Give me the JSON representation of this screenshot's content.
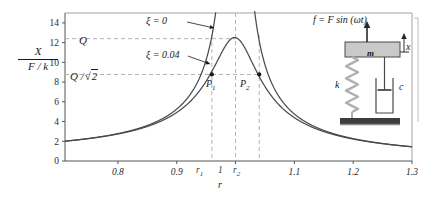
{
  "figure": {
    "y_axis_label_num": "X",
    "y_axis_label_den": "F / k",
    "x_axis_label": "r",
    "level_labels": {
      "q": "Q",
      "q_over_sqrt2_prefix": "Q /",
      "q_over_sqrt2_radicand": "2"
    },
    "point_labels": {
      "p1": "P",
      "p1_sub": "1",
      "p2": "P",
      "p2_sub": "2"
    },
    "curve_labels": {
      "undamped": "ξ = 0",
      "damped": "ξ = 0.04"
    },
    "special_x_ticks": {
      "r1": "r",
      "r1_sub": "1",
      "r2": "r",
      "r2_sub": "2",
      "unity": "1"
    },
    "colors": {
      "curve": "#4a4a52",
      "axis": "#8a8a8a",
      "dashed": "#a8a8b0",
      "mass_fill": "#c9c9c9",
      "ground": "#3d3d3d",
      "spring": "#b0b0b0"
    }
  },
  "inset": {
    "force_label": "f = F sin (ωt)",
    "mass_label": "m",
    "spring_label": "k",
    "damper_label": "c",
    "displacement_label": "x"
  },
  "chart_data": {
    "type": "line",
    "title": "",
    "xlabel": "r",
    "ylabel": "X / (F / k)",
    "xlim": [
      0.71,
      1.3
    ],
    "ylim": [
      0,
      15
    ],
    "xticks": [
      0.8,
      0.9,
      1.0,
      1.1,
      1.2,
      1.3
    ],
    "xtick_labels": [
      "0.8",
      "0.9",
      "1",
      "1.1",
      "1.2",
      "1.3"
    ],
    "yticks": [
      0,
      2,
      4,
      6,
      8,
      10,
      12,
      14
    ],
    "ytick_labels": [
      "0",
      "2",
      "4",
      "6",
      "8",
      "10",
      "12",
      "14"
    ],
    "grid": false,
    "legend": "annotations",
    "annotations": [
      {
        "text": "ξ = 0",
        "x": 0.875,
        "y": 14.2,
        "arrow_to_x": 0.985,
        "arrow_to_y": 13.0
      },
      {
        "text": "ξ = 0.04",
        "x": 0.875,
        "y": 10.6,
        "arrow_to_x": 0.963,
        "arrow_to_y": 9.6
      },
      {
        "text": "P1",
        "x": 0.968,
        "y": 8.0
      },
      {
        "text": "P2",
        "x": 1.042,
        "y": 8.0
      }
    ],
    "hlines": [
      {
        "label": "Q",
        "y": 12.4
      },
      {
        "label": "Q/√2",
        "y": 8.77
      }
    ],
    "vlines": [
      {
        "label": "r1",
        "x": 0.9597
      },
      {
        "label": "1",
        "x": 1.0
      },
      {
        "label": "r2",
        "x": 1.0403
      }
    ],
    "markers": [
      {
        "name": "P1",
        "x": 0.9597,
        "y": 8.77
      },
      {
        "name": "P2",
        "x": 1.0403,
        "y": 8.77
      }
    ],
    "series": [
      {
        "name": "ξ = 0",
        "damping_ratio": 0.0,
        "formula": "1/|1-r^2|",
        "asymptote_x": 1.0
      },
      {
        "name": "ξ = 0.04",
        "damping_ratio": 0.04,
        "formula": "1/sqrt((1-r^2)^2+(2*0.04*r)^2)",
        "peak_x": 0.9984,
        "peak_y": 12.51
      }
    ]
  }
}
